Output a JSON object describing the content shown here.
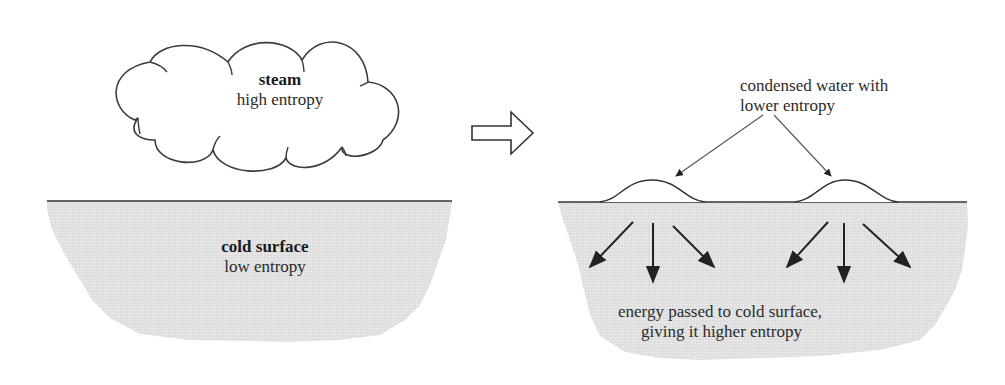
{
  "diagram": {
    "left_panel": {
      "cloud": {
        "title": "steam",
        "subtitle": "high entropy"
      },
      "surface": {
        "title": "cold surface",
        "subtitle": "low entropy"
      }
    },
    "transition_arrow": {
      "icon": "hollow-right-arrow-icon"
    },
    "right_panel": {
      "annotation": {
        "line1": "condensed water with",
        "line2": "lower entropy"
      },
      "droplets_count": 2,
      "energy_arrows_per_droplet": 3,
      "surface_caption": {
        "line1": "energy passed to cold surface,",
        "line2": "giving it higher entropy"
      }
    },
    "colors": {
      "surface_fill": "#e2e2e2",
      "stroke": "#3a3a3a",
      "background": "#ffffff"
    }
  }
}
